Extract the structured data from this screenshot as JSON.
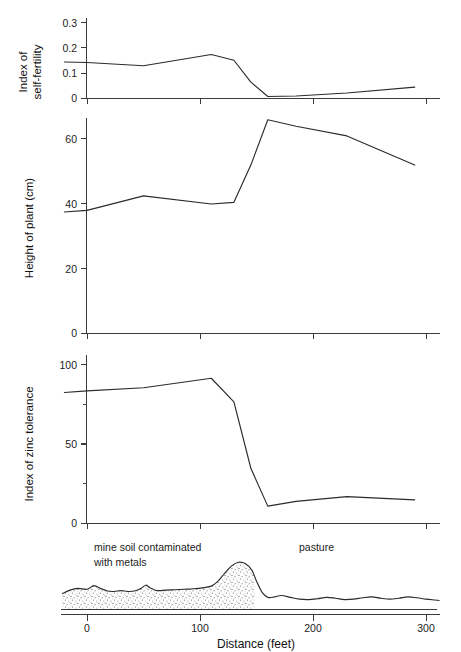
{
  "figure": {
    "xaxis": {
      "label": "Distance (feet)",
      "ticks": [
        0,
        100,
        200,
        300
      ],
      "tick_labels": [
        "0",
        "100",
        "200",
        "300"
      ],
      "range": [
        -22,
        312
      ],
      "units": "feet"
    },
    "zone_labels": {
      "left_line1": "mine soil contaminated",
      "left_line2": "with metals",
      "right": "pasture"
    },
    "boundary_feet": 148
  },
  "chart_data": [
    {
      "type": "line",
      "panel": 1,
      "title": "",
      "ylabel": "Index of\nself-fertility",
      "ylabel_line1": "Index of",
      "ylabel_line2": "self-fertility",
      "xlabel": "Distance (feet)",
      "ylim": [
        0,
        0.32
      ],
      "yticks": [
        0,
        0.1,
        0.2,
        0.3
      ],
      "ytick_labels": [
        "0",
        "0.1",
        "0.2",
        "0.3"
      ],
      "grid": false,
      "legend": "none",
      "x": [
        -20,
        0,
        50,
        110,
        130,
        145,
        160,
        185,
        230,
        290
      ],
      "values": [
        0.145,
        0.143,
        0.13,
        0.175,
        0.152,
        0.065,
        0.008,
        0.01,
        0.022,
        0.045
      ]
    },
    {
      "type": "line",
      "panel": 2,
      "title": "",
      "ylabel": "Height of plant (cm)",
      "xlabel": "Distance (feet)",
      "ylim": [
        0,
        67
      ],
      "yticks": [
        0,
        20,
        40,
        60
      ],
      "ytick_labels": [
        "0",
        "20",
        "40",
        "60"
      ],
      "grid": false,
      "legend": "none",
      "x": [
        -20,
        0,
        50,
        110,
        130,
        145,
        160,
        185,
        230,
        290
      ],
      "values": [
        37.5,
        38.0,
        42.5,
        40.0,
        40.5,
        52.0,
        66.0,
        64.0,
        61.0,
        52.0
      ]
    },
    {
      "type": "line",
      "panel": 3,
      "title": "",
      "ylabel": "Index of zinc tolerance",
      "xlabel": "Distance (feet)",
      "ylim": [
        0,
        108
      ],
      "yticks": [
        0,
        50,
        100
      ],
      "ytick_labels": [
        "0",
        "50",
        "100"
      ],
      "minor_yticks": [
        25,
        75
      ],
      "grid": false,
      "legend": "none",
      "x": [
        -20,
        0,
        50,
        110,
        130,
        145,
        160,
        185,
        230,
        290
      ],
      "values": [
        83,
        84,
        86,
        92,
        77,
        35,
        11,
        14,
        17,
        15
      ]
    },
    {
      "type": "area",
      "panel": 4,
      "title": "Soil profile transect",
      "ylabel": "",
      "xlabel": "Distance (feet)",
      "grid": false,
      "legend": "none",
      "annotations": [
        "mine soil contaminated with metals",
        "pasture"
      ],
      "x": [
        -22,
        -15,
        -8,
        0,
        6,
        12,
        18,
        24,
        30,
        36,
        42,
        48,
        52,
        56,
        62,
        70,
        78,
        86,
        94,
        102,
        110,
        116,
        122,
        128,
        134,
        140,
        146,
        150,
        155,
        160,
        166,
        172,
        180,
        188,
        196,
        204,
        212,
        220,
        228,
        236,
        244,
        252,
        260,
        268,
        276,
        284,
        292,
        300,
        308,
        312
      ],
      "surface": [
        7.0,
        8.6,
        9.4,
        9.0,
        10.6,
        9.4,
        8.2,
        8.0,
        8.4,
        8.0,
        8.2,
        9.4,
        10.8,
        9.6,
        8.4,
        8.6,
        8.8,
        9.0,
        9.2,
        9.6,
        10.4,
        12.6,
        16.2,
        19.4,
        21.0,
        20.4,
        17.4,
        12.6,
        7.6,
        5.4,
        5.6,
        6.2,
        5.4,
        4.6,
        4.4,
        4.8,
        5.4,
        5.0,
        4.4,
        4.6,
        5.2,
        5.6,
        5.0,
        4.6,
        5.0,
        5.6,
        5.2,
        4.6,
        4.2,
        4.0
      ]
    }
  ]
}
